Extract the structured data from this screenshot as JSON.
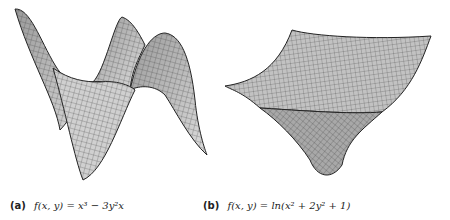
{
  "figures": [
    {
      "id": "a",
      "label": "(a)",
      "formula": "f(x, y) = x³ − 3y²x",
      "description": "Monkey saddle surface rendered as gray wireframe mesh"
    },
    {
      "id": "b",
      "label": "(b)",
      "formula": "f(x, y) = ln(x² + 2y² + 1)",
      "description": "Bowl-shaped logarithmic surface rendered as gray wireframe mesh"
    }
  ],
  "style": {
    "surface_fill": "#b8b8b8",
    "surface_fill_light": "#d6d6d6",
    "mesh_line": "#333333",
    "outline": "#222222"
  }
}
